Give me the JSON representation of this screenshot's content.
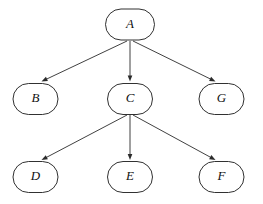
{
  "diagram": {
    "background_color": "#ffffff",
    "node_fill": "#ffffff",
    "node_stroke": "#1a1a1a",
    "edge_color": "#2b2b2b",
    "label_color": "#111111",
    "nodes": [
      {
        "id": "A",
        "label": "A",
        "cx": 130,
        "cy": 24.5,
        "rx": 24.5,
        "ry": 15.5
      },
      {
        "id": "B",
        "label": "B",
        "cx": 35.5,
        "cy": 99.0,
        "rx": 22.5,
        "ry": 15.5
      },
      {
        "id": "C",
        "label": "C",
        "cx": 130,
        "cy": 99.0,
        "rx": 22.5,
        "ry": 15.5
      },
      {
        "id": "G",
        "label": "G",
        "cx": 221.5,
        "cy": 99.0,
        "rx": 22.5,
        "ry": 15.5
      },
      {
        "id": "D",
        "label": "D",
        "cx": 35.5,
        "cy": 177.0,
        "rx": 22.5,
        "ry": 15.5
      },
      {
        "id": "E",
        "label": "E",
        "cx": 130,
        "cy": 177.0,
        "rx": 22.5,
        "ry": 15.5
      },
      {
        "id": "F",
        "label": "F",
        "cx": 221.5,
        "cy": 177.0,
        "rx": 22.5,
        "ry": 15.5
      }
    ],
    "edges": [
      {
        "id": "A-B",
        "from": "A",
        "to": "B",
        "x1": 127,
        "y1": 41,
        "x2": 41.5,
        "y2": 81.5
      },
      {
        "id": "A-C",
        "from": "A",
        "to": "C",
        "x1": 130,
        "y1": 41,
        "x2": 130,
        "y2": 81.5
      },
      {
        "id": "A-G",
        "from": "A",
        "to": "G",
        "x1": 133,
        "y1": 41,
        "x2": 215.5,
        "y2": 81.5
      },
      {
        "id": "C-D",
        "from": "C",
        "to": "D",
        "x1": 127,
        "y1": 115,
        "x2": 41.5,
        "y2": 160.0
      },
      {
        "id": "C-E",
        "from": "C",
        "to": "E",
        "x1": 130,
        "y1": 115,
        "x2": 130,
        "y2": 160.0
      },
      {
        "id": "C-F",
        "from": "C",
        "to": "F",
        "x1": 133,
        "y1": 115,
        "x2": 215.5,
        "y2": 160.0
      }
    ]
  }
}
